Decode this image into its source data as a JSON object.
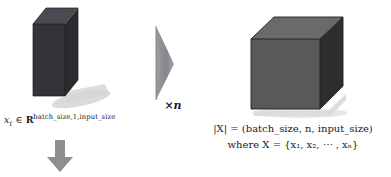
{
  "figure": {
    "background_color": "#ffffff",
    "title": ""
  },
  "slab": {
    "name": "input-slab",
    "front_color": "#333338",
    "top_color": "#4a4a50",
    "side_color": "#2a2a2e",
    "shadow_color": "#c9c9c9",
    "caption": {
      "variable": "x",
      "subscript": "t",
      "relation": "∈",
      "set_symbol": "R",
      "exponent": "batch_size,1,input_size",
      "full_text": "x_t ∈ R^{batch_size,1,input_size}"
    }
  },
  "shard": {
    "name": "repeat-shard",
    "fill_color": "#8d8d91",
    "edge_color": "#6f6f74",
    "multiplier_prefix": "×",
    "multiplier_symbol": "n",
    "multiplier_text": "×n"
  },
  "cube": {
    "name": "sequence-cube",
    "front_color": "#59595c",
    "top_color": "#6a6a6c",
    "side_color": "#2e2e30",
    "edge_color": "#1f1f21",
    "shadow_color": "#d2d2d2",
    "caption": {
      "line1": "|X| = (batch_size, n, input_size)",
      "line2_prefix": "where",
      "line2_var": "X",
      "line2_eq": "=",
      "line2_set": "{x₁, x₂, ⋯ , xₙ}",
      "line2_full": "where X = {x₁, x₂, ⋯ , xₙ}"
    }
  },
  "arrow": {
    "name": "down-arrow",
    "direction": "down",
    "color": "#8f8f8f",
    "label": ""
  }
}
